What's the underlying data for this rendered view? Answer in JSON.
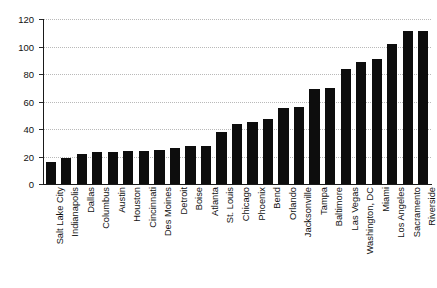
{
  "chart_data": {
    "type": "bar",
    "title": "",
    "subtitle": "",
    "xlabel": "",
    "ylabel": "",
    "ylim": [
      0,
      120
    ],
    "yticks": [
      0,
      20,
      40,
      60,
      80,
      100,
      120
    ],
    "grid": true,
    "legend": false,
    "bar_color": "#0d0d0d",
    "grid_color": "#b9b9b9",
    "axis_color": "#1a1a1a",
    "categories": [
      "Salt Lake City",
      "Indianapolis",
      "Dallas",
      "Columbus",
      "Austin",
      "Houston",
      "Cincinnati",
      "Des Moines",
      "Detroit",
      "Boise",
      "Atlanta",
      "St. Louis",
      "Chicago",
      "Phoenix",
      "Bend",
      "Orlando",
      "Jacksonville",
      "Tampa",
      "Baltimore",
      "Las Vegas",
      "Washington, DC",
      "Miami",
      "Los Angeles",
      "Sacramento",
      "Riverside"
    ],
    "values": [
      16,
      19,
      22,
      23,
      23,
      24,
      24,
      25,
      26,
      28,
      28,
      38,
      44,
      45,
      47,
      55,
      56,
      69,
      70,
      84,
      89,
      91,
      102,
      111,
      111
    ]
  }
}
